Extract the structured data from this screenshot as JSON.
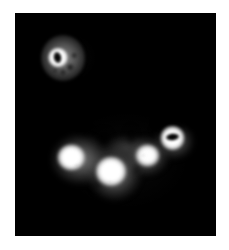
{
  "figure": {
    "title": "Grayscale imaging panel",
    "modality": "grayscale-intensity-image",
    "background_color": "#ffffff",
    "panel_color": "#000000",
    "panel": {
      "x": 15,
      "y": 13,
      "width": 201,
      "height": 223
    },
    "canvas": {
      "width": 229,
      "height": 250
    },
    "caption": "",
    "scale_bar": "",
    "annotations": []
  },
  "chart_data": {
    "type": "heatmap",
    "title": "",
    "xlabel": "",
    "ylabel": "",
    "colormap": "grayscale",
    "value_range": [
      0,
      255
    ],
    "background_value": 0,
    "grid": false,
    "legend": "none",
    "regions": [
      {
        "id": "roi-top-left",
        "label": "Top-left ring structure",
        "shape": "ring",
        "center": [
          48,
          53
        ],
        "width": 44,
        "height": 46,
        "peak_intensity": 255,
        "rim_intensity": 255,
        "core_intensity": 0,
        "surround_intensity": 96
      },
      {
        "id": "lobe-1",
        "label": "Cluster lobe 1 (left)",
        "shape": "filled-blob",
        "center": [
          64,
          149
        ],
        "width": 34,
        "height": 32,
        "peak_intensity": 255,
        "surround_intensity": 130
      },
      {
        "id": "lobe-2",
        "label": "Cluster lobe 2 (center)",
        "shape": "filled-blob",
        "center": [
          103,
          162
        ],
        "width": 34,
        "height": 34,
        "peak_intensity": 255,
        "surround_intensity": 134
      },
      {
        "id": "lobe-3",
        "label": "Cluster lobe 3 (right of center)",
        "shape": "filled-blob",
        "center": [
          139,
          146
        ],
        "width": 27,
        "height": 26,
        "peak_intensity": 253,
        "surround_intensity": 124
      },
      {
        "id": "lobe-4",
        "label": "Cluster lobe 4 (far right ring)",
        "shape": "ring",
        "center": [
          163,
          127
        ],
        "width": 27,
        "height": 28,
        "peak_intensity": 255,
        "core_intensity": 0,
        "surround_intensity": 110
      }
    ],
    "structure_counts": {
      "rings": 2,
      "filled_blobs": 3,
      "total_regions": 5
    }
  }
}
